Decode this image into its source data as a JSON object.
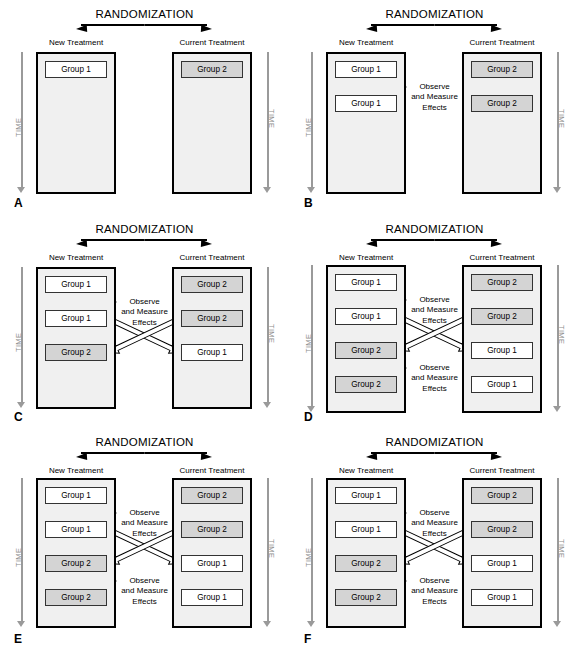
{
  "figure": {
    "title_text": "RANDOMIZATION",
    "arm_left_label": "New Treatment",
    "arm_right_label": "Current Treatment",
    "time_label": "TIME",
    "observe_line1": "Observe",
    "observe_line2": "and Measure",
    "observe_line3": "Effects",
    "group1": "Group 1",
    "group2": "Group 2",
    "colors": {
      "shaded_box": "#d4d4d4",
      "white_box": "#ffffff",
      "arm_fill": "#f0f0f0",
      "arm_stroke": "#000000",
      "time_gray": "#9a9a9a",
      "highlight_ellipse": "#8f8f8f"
    }
  },
  "panels": [
    {
      "id": "A",
      "label": "A",
      "title": "RANDOMIZATION",
      "arms": {
        "left": "New Treatment",
        "right": "Current Treatment"
      },
      "time_label": "TIME",
      "rows": [
        {
          "left": "Group 1",
          "left_shaded": false,
          "right": "Group 2",
          "right_shaded": true
        }
      ],
      "observe_labels": [],
      "crossover": false,
      "highlights": []
    },
    {
      "id": "B",
      "label": "B",
      "title": "RANDOMIZATION",
      "arms": {
        "left": "New Treatment",
        "right": "Current Treatment"
      },
      "time_label": "TIME",
      "rows": [
        {
          "left": "Group 1",
          "left_shaded": false,
          "right": "Group 2",
          "right_shaded": true
        },
        {
          "left": "Group 1",
          "left_shaded": false,
          "right": "Group 2",
          "right_shaded": true
        }
      ],
      "observe_labels": [
        "Observe / and Measure / Effects"
      ],
      "crossover": false,
      "highlights": []
    },
    {
      "id": "C",
      "label": "C",
      "title": "RANDOMIZATION",
      "arms": {
        "left": "New Treatment",
        "right": "Current Treatment"
      },
      "time_label": "TIME",
      "rows": [
        {
          "left": "Group 1",
          "left_shaded": false,
          "right": "Group 2",
          "right_shaded": true
        },
        {
          "left": "Group 1",
          "left_shaded": false,
          "right": "Group 2",
          "right_shaded": true
        },
        {
          "left": "Group 2",
          "left_shaded": true,
          "right": "Group 1",
          "right_shaded": false
        }
      ],
      "observe_labels": [
        "Observe / and Measure / Effects"
      ],
      "crossover": true,
      "highlights": []
    },
    {
      "id": "D",
      "label": "D",
      "title": "RANDOMIZATION",
      "arms": {
        "left": "New Treatment",
        "right": "Current Treatment"
      },
      "time_label": "TIME",
      "rows": [
        {
          "left": "Group 1",
          "left_shaded": false,
          "right": "Group 2",
          "right_shaded": true
        },
        {
          "left": "Group 1",
          "left_shaded": false,
          "right": "Group 2",
          "right_shaded": true
        },
        {
          "left": "Group 2",
          "left_shaded": true,
          "right": "Group 1",
          "right_shaded": false
        },
        {
          "left": "Group 2",
          "left_shaded": true,
          "right": "Group 1",
          "right_shaded": false
        }
      ],
      "observe_labels": [
        "Observe / and Measure / Effects",
        "Observe / and Measure / Effects"
      ],
      "crossover": true,
      "highlights": []
    },
    {
      "id": "E",
      "label": "E",
      "title": "RANDOMIZATION",
      "arms": {
        "left": "New Treatment",
        "right": "Current Treatment"
      },
      "time_label": "TIME",
      "rows": [
        {
          "left": "Group 1",
          "left_shaded": false,
          "right": "Group 2",
          "right_shaded": true
        },
        {
          "left": "Group 1",
          "left_shaded": false,
          "right": "Group 2",
          "right_shaded": true
        },
        {
          "left": "Group 2",
          "left_shaded": true,
          "right": "Group 1",
          "right_shaded": false
        },
        {
          "left": "Group 2",
          "left_shaded": true,
          "right": "Group 1",
          "right_shaded": false
        }
      ],
      "observe_labels": [
        "Observe / and Measure / Effects",
        "Observe / and Measure / Effects"
      ],
      "crossover": true,
      "highlights": [
        "left-arrow-row1",
        "right-arrow-row3"
      ]
    },
    {
      "id": "F",
      "label": "F",
      "title": "RANDOMIZATION",
      "arms": {
        "left": "New Treatment",
        "right": "Current Treatment"
      },
      "time_label": "TIME",
      "rows": [
        {
          "left": "Group 1",
          "left_shaded": false,
          "right": "Group 2",
          "right_shaded": true
        },
        {
          "left": "Group 1",
          "left_shaded": false,
          "right": "Group 2",
          "right_shaded": true
        },
        {
          "left": "Group 2",
          "left_shaded": true,
          "right": "Group 1",
          "right_shaded": false
        },
        {
          "left": "Group 2",
          "left_shaded": true,
          "right": "Group 1",
          "right_shaded": false
        }
      ],
      "observe_labels": [
        "Observe / and Measure / Effects",
        "Observe / and Measure / Effects"
      ],
      "crossover": true,
      "highlights": [
        "right-arrow-row1",
        "left-arrow-row3"
      ]
    }
  ]
}
